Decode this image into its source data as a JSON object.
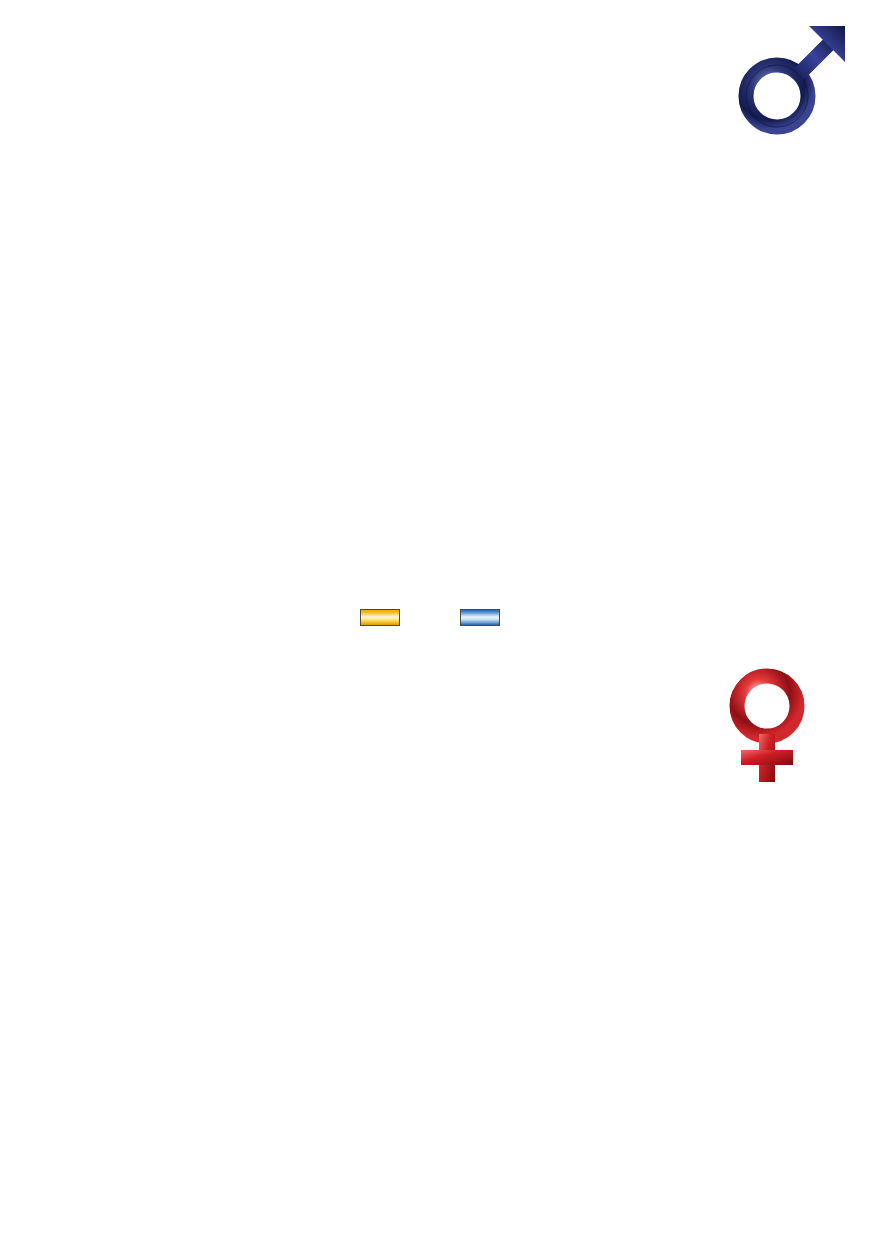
{
  "footnote": "Angaben nach dem Bundeskrebsinstitut der USA",
  "legend": [
    {
      "label": "1958-1960",
      "color": "#f4c020",
      "series_key": "1958-1960"
    },
    {
      "label": "1988-1990",
      "color": "#5b93cf",
      "series_key": "1988-1990"
    }
  ],
  "symbols": {
    "male": "male-gender-symbol",
    "female": "female-gender-symbol"
  },
  "chart_data": [
    {
      "id": "men",
      "type": "bar",
      "orientation": "horizontal",
      "title": "",
      "xlabel": "",
      "ylabel": "",
      "xlim": [
        0,
        75
      ],
      "xticks": [
        0,
        5,
        10,
        15,
        20,
        25,
        30,
        35,
        40,
        45,
        50,
        55,
        60,
        65,
        70,
        75
      ],
      "grid": true,
      "legend_position": "bottom-center",
      "categories": [
        "Mund",
        "Speiseröhre",
        "Magen",
        "Dickdarm",
        "Kehlkopf",
        "Lunge",
        "Prostata",
        "Niere",
        "Harnblase",
        "Gehirn"
      ],
      "series": [
        {
          "name": "1958-1960",
          "color": "#f4c020",
          "values": [
            6.0,
            4.9,
            17.8,
            17.0,
            2.7,
            36.1,
            20.8,
            4.0,
            7.2,
            4.2
          ]
        },
        {
          "name": "1988-1990",
          "color": "#5b93cf",
          "values": [
            4.8,
            5.8,
            6.7,
            20.2,
            2.5,
            74.1,
            25.3,
            5.1,
            6.0,
            5.3
          ]
        }
      ]
    },
    {
      "id": "women",
      "type": "bar",
      "orientation": "horizontal",
      "title": "",
      "xlabel": "",
      "ylabel": "",
      "xlim": [
        0,
        35
      ],
      "xticks": [
        0,
        5,
        10,
        15,
        20,
        25,
        30,
        35
      ],
      "grid": true,
      "legend_position": "bottom-center",
      "categories": [
        "Mund",
        "Speiseröhre",
        "Magen",
        "Dickdarm",
        "Kehlkopf",
        "Lunge",
        "Brust",
        "Eierstöcke",
        "Gebärmutterhals",
        "Niere",
        "Harnblase",
        "Gehirn"
      ],
      "series": [
        {
          "name": "1958-1960",
          "color": "#f4c020",
          "values": [
            1.8,
            1.3,
            9.0,
            17.4,
            0.3,
            5.6,
            25.8,
            8.9,
            9.6,
            2.0,
            2.9,
            2.8
          ]
        },
        {
          "name": "1988-1990",
          "color": "#5b93cf",
          "values": [
            2.0,
            1.7,
            3.3,
            14.4,
            0.3,
            30.5,
            27.5,
            8.2,
            3.1,
            2.6,
            1.9,
            3.4
          ]
        }
      ]
    }
  ]
}
